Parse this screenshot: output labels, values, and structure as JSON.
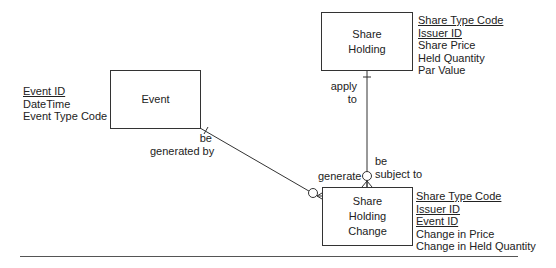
{
  "entities": {
    "event": {
      "name_lines": [
        "Event"
      ],
      "attributes": [
        {
          "text": "Event ID",
          "key": true
        },
        {
          "text": "DateTime",
          "key": false
        },
        {
          "text": "Event Type Code",
          "key": false
        }
      ]
    },
    "share_holding": {
      "name_lines": [
        "Share",
        "Holding"
      ],
      "attributes": [
        {
          "text": "Share Type Code",
          "key": true
        },
        {
          "text": "Issuer ID",
          "key": true
        },
        {
          "text": "Share Price",
          "key": false
        },
        {
          "text": "Held Quantity",
          "key": false
        },
        {
          "text": "Par Value",
          "key": false
        }
      ]
    },
    "share_holding_change": {
      "name_lines": [
        "Share",
        "Holding",
        "Change"
      ],
      "attributes": [
        {
          "text": "Share Type Code",
          "key": true
        },
        {
          "text": "Issuer ID",
          "key": true
        },
        {
          "text": "Event ID",
          "key": true
        },
        {
          "text": "Change in Price",
          "key": false
        },
        {
          "text": "Change in Held Quantity",
          "key": false
        }
      ]
    }
  },
  "relationships": {
    "event_change": {
      "label_event_side": [
        "be",
        "generated by"
      ],
      "label_change_side": "generate"
    },
    "holding_change": {
      "label_holding_side": [
        "apply",
        "to"
      ],
      "label_change_side": [
        "be",
        "subject to"
      ]
    }
  },
  "colors": {
    "line": "#333333",
    "text": "#222222",
    "rule": "#555555"
  }
}
